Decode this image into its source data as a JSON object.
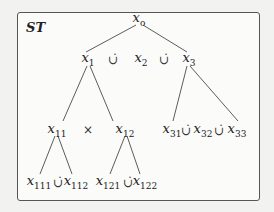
{
  "title": "ST",
  "nodes": {
    "root": {
      "base": "x",
      "sub": "o"
    },
    "x1": {
      "base": "x",
      "sub": "1"
    },
    "x2": {
      "base": "x",
      "sub": "2"
    },
    "x3": {
      "base": "x",
      "sub": "3"
    },
    "x11": {
      "base": "x",
      "sub": "11"
    },
    "x12": {
      "base": "x",
      "sub": "12"
    },
    "x31": {
      "base": "x",
      "sub": "31"
    },
    "x32": {
      "base": "x",
      "sub": "32"
    },
    "x33": {
      "base": "x",
      "sub": "33"
    },
    "x111": {
      "base": "x",
      "sub": "111"
    },
    "x112": {
      "base": "x",
      "sub": "112"
    },
    "x121": {
      "base": "x",
      "sub": "121"
    },
    "x122": {
      "base": "x",
      "sub": "122"
    }
  },
  "operators": {
    "disjoint_union": "∪̇",
    "product": "×"
  }
}
